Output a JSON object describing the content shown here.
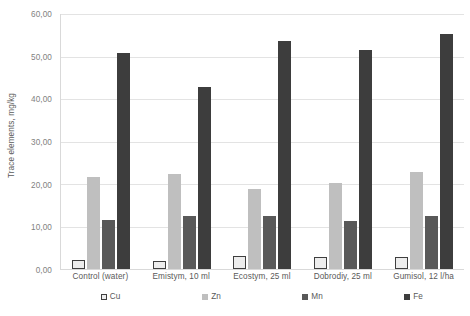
{
  "chart_data": {
    "type": "bar",
    "title": "",
    "xlabel": "",
    "ylabel": "Trace elements, mg/kg",
    "ylim": [
      0,
      60
    ],
    "ytick_step": 10,
    "ytick_labels": [
      "60,00",
      "50,00",
      "40,00",
      "30,00",
      "20,00",
      "10,00",
      "0,00"
    ],
    "ytick_values": [
      60,
      50,
      40,
      30,
      20,
      10,
      0
    ],
    "grid": true,
    "legend_position": "bottom",
    "decimal_separator": ",",
    "categories": [
      "Control (water)",
      "Emistym, 10 ml",
      "Ecostym, 25 ml",
      "Dobrodiy, 25 ml",
      "Gumisol, 12 l/ha"
    ],
    "series": [
      {
        "name": "Cu",
        "color": "#ededed",
        "border_color": "#3f3f3f",
        "values": [
          2.1,
          2.0,
          3.1,
          2.8,
          2.9
        ]
      },
      {
        "name": "Zn",
        "color": "#bfbfbf",
        "border_color": "#bfbfbf",
        "values": [
          21.6,
          22.3,
          18.8,
          20.3,
          22.9
        ]
      },
      {
        "name": "Mn",
        "color": "#595959",
        "border_color": "#595959",
        "values": [
          11.6,
          12.4,
          12.4,
          11.4,
          12.4
        ]
      },
      {
        "name": "Fe",
        "color": "#3d3d3d",
        "border_color": "#3d3d3d",
        "values": [
          50.9,
          42.9,
          53.7,
          51.5,
          55.4
        ]
      }
    ]
  },
  "legend": {
    "items": [
      {
        "label": "Cu"
      },
      {
        "label": "Zn"
      },
      {
        "label": "Mn"
      },
      {
        "label": "Fe"
      }
    ]
  }
}
